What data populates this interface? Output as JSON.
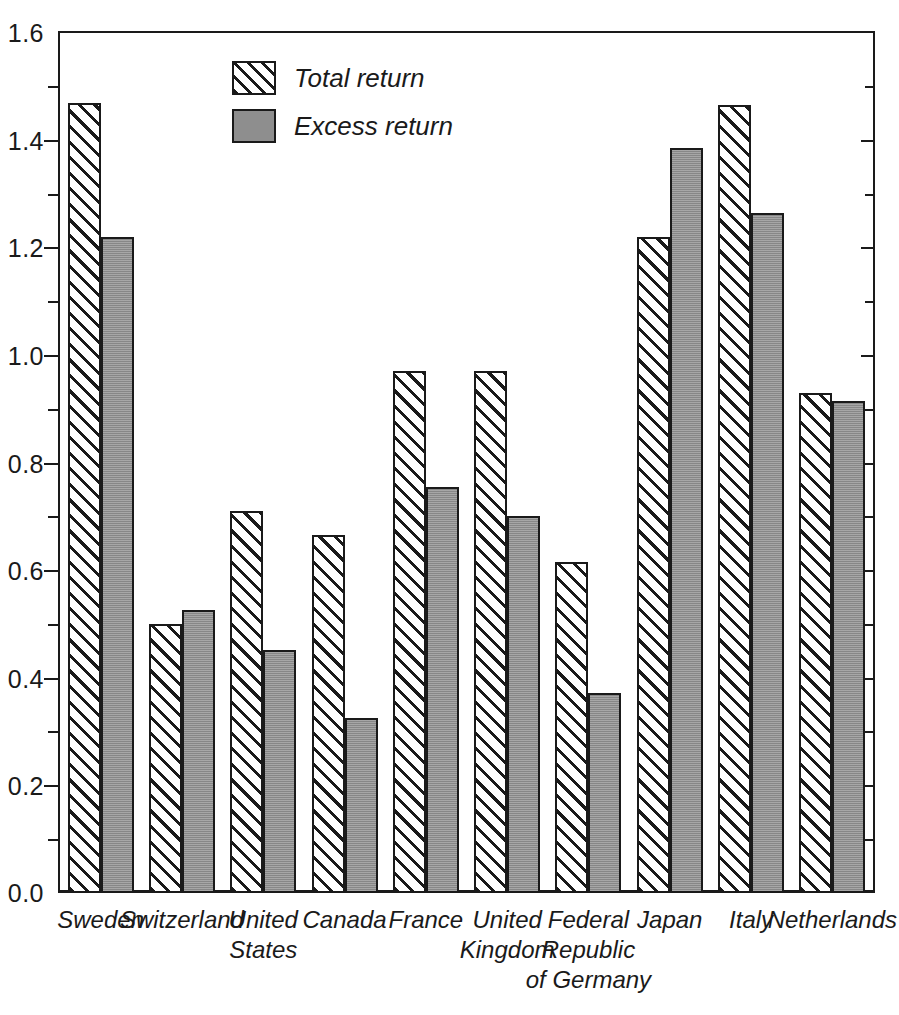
{
  "chart_data": {
    "type": "bar",
    "title": "",
    "xlabel": "",
    "ylabel": "",
    "ylim": [
      0.0,
      1.6
    ],
    "ytick_step": 0.2,
    "yminor_step": 0.1,
    "grid": false,
    "legend_position": "inside-top-left",
    "categories": [
      "Sweden",
      "Switzerland",
      "United\nStates",
      "Canada",
      "France",
      "United\nKingdom",
      "Federal\nRepublic\nof Germany",
      "Japan",
      "Italy",
      "Netherlands"
    ],
    "ytick_labels": [
      "0.0",
      "0.2",
      "0.4",
      "0.6",
      "0.8",
      "1.0",
      "1.2",
      "1.4",
      "1.6"
    ],
    "ytick_values": [
      0.0,
      0.2,
      0.4,
      0.6,
      0.8,
      1.0,
      1.2,
      1.4,
      1.6
    ],
    "series": [
      {
        "name": "Total return",
        "fill": "hatched",
        "color": "#ffffff",
        "values": [
          1.47,
          0.5,
          0.71,
          0.665,
          0.97,
          0.97,
          0.615,
          1.22,
          1.465,
          0.93
        ]
      },
      {
        "name": "Excess return",
        "fill": "solid-gray",
        "color": "#8e8e8e",
        "values": [
          1.22,
          0.525,
          0.45,
          0.325,
          0.755,
          0.7,
          0.37,
          1.385,
          1.265,
          0.915
        ]
      }
    ]
  },
  "legend": {
    "items": [
      {
        "label": "Total  return",
        "swatch": "hatched-swatch"
      },
      {
        "label": "Excess return",
        "swatch": "gray-swatch"
      }
    ]
  },
  "axis": {
    "y_labels": [
      "1.6",
      "1.4",
      "1.2",
      "1.0",
      "0.8",
      "0.6",
      "0.4",
      "0.2",
      "0.0"
    ]
  },
  "colors": {
    "ink": "#1a1a1a",
    "excess_fill": "#8e8e8e",
    "background": "#ffffff"
  }
}
